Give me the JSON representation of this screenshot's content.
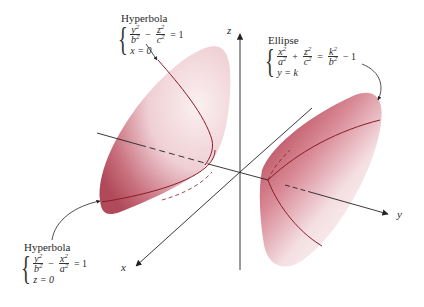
{
  "figure": {
    "axes": {
      "x": "x",
      "y": "y",
      "z": "z"
    },
    "colors": {
      "surface": "#b84a5a",
      "surface_light": "#f3dde0",
      "curve": "#8a1a2a",
      "axis": "#222222"
    },
    "annotations": [
      {
        "id": "hyperbola-top",
        "title": "Hyperbola",
        "eq1": {
          "t1_num": "y",
          "t1_den": "b",
          "op": "−",
          "t2_num": "z",
          "t2_den": "c",
          "rhs": "= 1"
        },
        "eq2": "x = 0"
      },
      {
        "id": "ellipse",
        "title": "Ellipse",
        "eq1": {
          "t1_num": "x",
          "t1_den": "a",
          "op": "+",
          "t2_num": "z",
          "t2_den": "c",
          "eq": "=",
          "t3_num": "k",
          "t3_den": "b",
          "rhs": "− 1"
        },
        "eq2": "y = k"
      },
      {
        "id": "hyperbola-bottom",
        "title": "Hyperbola",
        "eq1": {
          "t1_num": "y",
          "t1_den": "b",
          "op": "−",
          "t2_num": "x",
          "t2_den": "a",
          "rhs": "= 1"
        },
        "eq2": "z = 0"
      }
    ],
    "exponent": "2"
  }
}
